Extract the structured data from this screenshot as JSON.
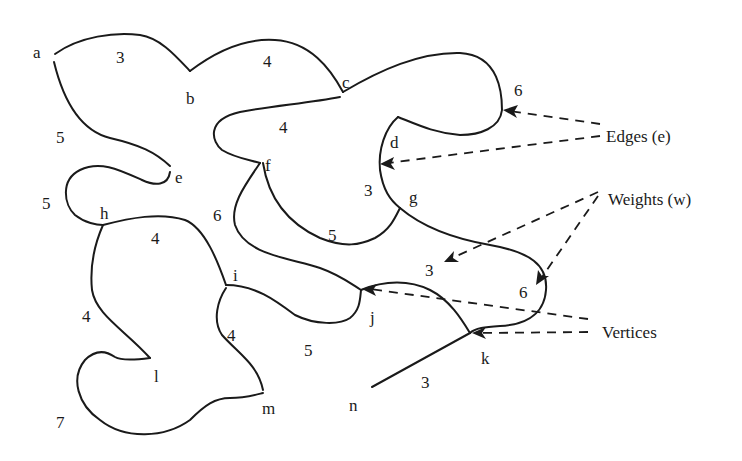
{
  "diagram": {
    "type": "weighted-graph",
    "colors": {
      "line": "#1a1a1a",
      "background": "#ffffff"
    },
    "vertices": [
      {
        "id": "a",
        "label": "a",
        "x": 37,
        "y": 58
      },
      {
        "id": "b",
        "label": "b",
        "x": 190,
        "y": 104
      },
      {
        "id": "c",
        "label": "c",
        "x": 346,
        "y": 87
      },
      {
        "id": "d",
        "label": "d",
        "x": 396,
        "y": 147
      },
      {
        "id": "e",
        "label": "e",
        "x": 181,
        "y": 182
      },
      {
        "id": "f",
        "label": "f",
        "x": 269,
        "y": 170
      },
      {
        "id": "g",
        "label": "g",
        "x": 415,
        "y": 201
      },
      {
        "id": "h",
        "label": "h",
        "x": 104,
        "y": 218
      },
      {
        "id": "i",
        "label": "i",
        "x": 236,
        "y": 280
      },
      {
        "id": "j",
        "label": "j",
        "x": 372,
        "y": 322
      },
      {
        "id": "k",
        "label": "k",
        "x": 486,
        "y": 362
      },
      {
        "id": "l",
        "label": "l",
        "x": 157,
        "y": 381
      },
      {
        "id": "m",
        "label": "m",
        "x": 269,
        "y": 413
      },
      {
        "id": "n",
        "label": "n",
        "x": 355,
        "y": 410
      }
    ],
    "edges": [
      {
        "from": "a",
        "to": "b",
        "weight": "3"
      },
      {
        "from": "b",
        "to": "c",
        "weight": "4"
      },
      {
        "from": "a",
        "to": "e",
        "weight": "5"
      },
      {
        "from": "c",
        "to": "f",
        "weight": "4"
      },
      {
        "from": "c",
        "to": "d",
        "weight": "6"
      },
      {
        "from": "d",
        "to": "g",
        "weight": "3"
      },
      {
        "from": "e",
        "to": "h",
        "weight": "5"
      },
      {
        "from": "f",
        "to": "g",
        "weight": "5"
      },
      {
        "from": "f",
        "to": "j",
        "weight": "6"
      },
      {
        "from": "h",
        "to": "i",
        "weight": "4"
      },
      {
        "from": "g",
        "to": "k",
        "weight": "6"
      },
      {
        "from": "j",
        "to": "k",
        "weight": "3"
      },
      {
        "from": "h",
        "to": "l",
        "weight": "4"
      },
      {
        "from": "i",
        "to": "j",
        "weight": "5"
      },
      {
        "from": "i",
        "to": "m",
        "weight": "4"
      },
      {
        "from": "l",
        "to": "m",
        "weight": "7"
      },
      {
        "from": "k",
        "to": "n",
        "weight": "3"
      }
    ],
    "weight_labels": [
      {
        "text": "3",
        "x": 121,
        "y": 63
      },
      {
        "text": "4",
        "x": 268,
        "y": 67
      },
      {
        "text": "5",
        "x": 61,
        "y": 143
      },
      {
        "text": "4",
        "x": 284,
        "y": 133
      },
      {
        "text": "6",
        "x": 519,
        "y": 96
      },
      {
        "text": "3",
        "x": 369,
        "y": 195
      },
      {
        "text": "5",
        "x": 47,
        "y": 208
      },
      {
        "text": "5",
        "x": 333,
        "y": 240
      },
      {
        "text": "6",
        "x": 218,
        "y": 221
      },
      {
        "text": "4",
        "x": 156,
        "y": 244
      },
      {
        "text": "3",
        "x": 430,
        "y": 276
      },
      {
        "text": "6",
        "x": 524,
        "y": 297
      },
      {
        "text": "4",
        "x": 87,
        "y": 322
      },
      {
        "text": "4",
        "x": 232,
        "y": 341
      },
      {
        "text": "5",
        "x": 309,
        "y": 355
      },
      {
        "text": "3",
        "x": 426,
        "y": 387
      },
      {
        "text": "7",
        "x": 61,
        "y": 427
      }
    ],
    "legend": {
      "edges": "Edges (e)",
      "weights": "Weights (w)",
      "vertices": "Vertices"
    }
  }
}
